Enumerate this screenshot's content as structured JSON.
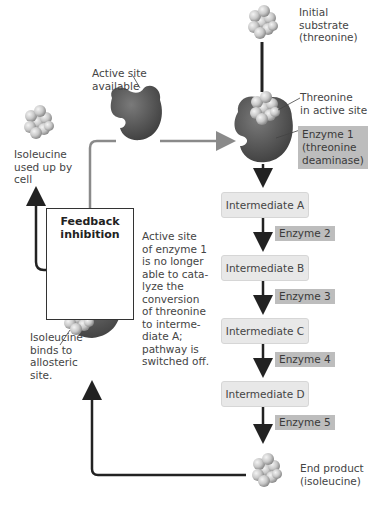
{
  "labels": {
    "initial_substrate": "Initial substrate (threonine)",
    "initial_substrate_lines": [
      "Initial",
      "substrate",
      "(threonine)"
    ],
    "active_site_available_lines": [
      "Active site",
      "available"
    ],
    "threonine_in_active_site_lines": [
      "Threonine",
      "in active site"
    ],
    "isoleucine_used_lines": [
      "Isoleucine",
      "used up by",
      "cell"
    ],
    "feedback_inhibition_lines": [
      "Feedback",
      "inhibition"
    ],
    "active_site_blocked_lines": [
      "Active site",
      "of enzyme 1",
      "is no longer",
      "able to cata-",
      "lyze the",
      "conversion",
      "of threonine",
      "to interme-",
      "diate A;",
      "pathway is",
      "switched off."
    ],
    "isoleucine_binds_lines": [
      "Isoleucine",
      "binds to",
      "allosteric",
      "site."
    ],
    "end_product_lines": [
      "End product",
      "(isoleucine)"
    ]
  },
  "enzyme1": {
    "lines": [
      "Enzyme 1",
      "(threonine",
      "deaminase)"
    ]
  },
  "intermediates": [
    "Intermediate A",
    "Intermediate B",
    "Intermediate C",
    "Intermediate D"
  ],
  "enzymes": [
    "Enzyme 2",
    "Enzyme 3",
    "Enzyme 4",
    "Enzyme 5"
  ],
  "colors": {
    "enzyme": "#5a5a5a",
    "intermediate_box": "#e8e8e8",
    "enzyme_label_box": "#bdbdbd",
    "arrow": "#222222",
    "gray_arrow": "#8a8a8a"
  }
}
